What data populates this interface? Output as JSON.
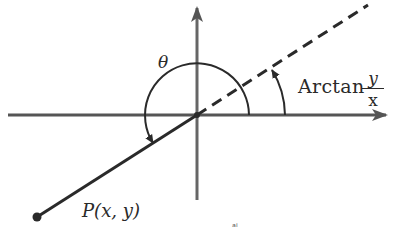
{
  "diagram": {
    "type": "coordinate-angle-diagram",
    "labels": {
      "theta": "θ",
      "arctan_word": "Arctan",
      "arctan_numerator": "y",
      "arctan_denominator": "x",
      "point": "P(x, y)",
      "stray_mark": "ᵃⁱ"
    },
    "colors": {
      "ink": "#2a2a2a",
      "axis": "#555555",
      "background": "#ffffff"
    },
    "geometry": {
      "origin": [
        197,
        115
      ],
      "x_axis": {
        "from": [
          8,
          115
        ],
        "to": [
          388,
          115
        ]
      },
      "y_axis": {
        "from": [
          197,
          200
        ],
        "to": [
          197,
          6
        ]
      },
      "point_P": [
        37,
        217
      ],
      "dashed_ray_end": [
        368,
        5
      ],
      "theta_arc_radius": 52,
      "arctan_arc_radius": 88
    }
  }
}
